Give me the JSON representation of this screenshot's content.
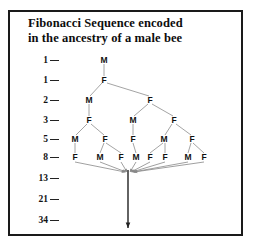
{
  "figure": {
    "title_line_1": "Fibonacci Sequence encoded",
    "title_line_2": "in the ancestry of a male bee",
    "background_color": "#ffffff",
    "frame_color": "#1a1a1a",
    "text_color": "#111111",
    "line_color": "#9a9a9a",
    "arrow_color": "#222222"
  },
  "chart_data": {
    "type": "diagram",
    "title": "Fibonacci Sequence encoded in the ancestry of a male bee",
    "xlabel": "",
    "ylabel": "Fibonacci number (number of ancestors in generation)",
    "categories": [
      "1",
      "1",
      "2",
      "3",
      "5",
      "8",
      "13",
      "21",
      "34"
    ],
    "values": [
      1,
      1,
      2,
      3,
      5,
      8,
      13,
      21,
      34
    ],
    "grid": false,
    "legend": "none",
    "generations": [
      {
        "fib": "1",
        "y": 60,
        "nodes": [
          {
            "sex": "M",
            "x": 104
          }
        ]
      },
      {
        "fib": "1",
        "y": 80,
        "nodes": [
          {
            "sex": "F",
            "x": 104
          }
        ]
      },
      {
        "fib": "2",
        "y": 100,
        "nodes": [
          {
            "sex": "M",
            "x": 89
          },
          {
            "sex": "F",
            "x": 150
          }
        ]
      },
      {
        "fib": "3",
        "y": 120,
        "nodes": [
          {
            "sex": "F",
            "x": 89
          },
          {
            "sex": "M",
            "x": 133
          },
          {
            "sex": "F",
            "x": 174
          }
        ]
      },
      {
        "fib": "5",
        "y": 139,
        "nodes": [
          {
            "sex": "M",
            "x": 75
          },
          {
            "sex": "F",
            "x": 105
          },
          {
            "sex": "F",
            "x": 133
          },
          {
            "sex": "M",
            "x": 164
          },
          {
            "sex": "F",
            "x": 192
          }
        ]
      },
      {
        "fib": "8",
        "y": 157,
        "nodes": [
          {
            "sex": "F",
            "x": 75
          },
          {
            "sex": "M",
            "x": 100
          },
          {
            "sex": "F",
            "x": 121
          },
          {
            "sex": "M",
            "x": 136
          },
          {
            "sex": "F",
            "x": 150
          },
          {
            "sex": "F",
            "x": 165
          },
          {
            "sex": "M",
            "x": 188
          },
          {
            "sex": "F",
            "x": 204
          }
        ]
      },
      {
        "fib": "13",
        "y": 178,
        "nodes": []
      },
      {
        "fib": "21",
        "y": 199,
        "nodes": []
      },
      {
        "fib": "34",
        "y": 220,
        "nodes": []
      }
    ],
    "edges": [
      {
        "x1": 104,
        "y1": 64,
        "x2": 104,
        "y2": 76
      },
      {
        "x1": 102,
        "y1": 83,
        "x2": 90,
        "y2": 96
      },
      {
        "x1": 107,
        "y1": 83,
        "x2": 149,
        "y2": 96
      },
      {
        "x1": 89,
        "y1": 104,
        "x2": 89,
        "y2": 116
      },
      {
        "x1": 148,
        "y1": 104,
        "x2": 134,
        "y2": 116
      },
      {
        "x1": 152,
        "y1": 104,
        "x2": 173,
        "y2": 116
      },
      {
        "x1": 87,
        "y1": 124,
        "x2": 76,
        "y2": 135
      },
      {
        "x1": 91,
        "y1": 124,
        "x2": 104,
        "y2": 135
      },
      {
        "x1": 133,
        "y1": 124,
        "x2": 133,
        "y2": 135
      },
      {
        "x1": 172,
        "y1": 124,
        "x2": 165,
        "y2": 135
      },
      {
        "x1": 176,
        "y1": 124,
        "x2": 191,
        "y2": 135
      },
      {
        "x1": 75,
        "y1": 143,
        "x2": 75,
        "y2": 153
      },
      {
        "x1": 104,
        "y1": 143,
        "x2": 100,
        "y2": 153
      },
      {
        "x1": 106,
        "y1": 143,
        "x2": 121,
        "y2": 153
      },
      {
        "x1": 133,
        "y1": 143,
        "x2": 136,
        "y2": 153
      },
      {
        "x1": 163,
        "y1": 143,
        "x2": 150,
        "y2": 153
      },
      {
        "x1": 165,
        "y1": 143,
        "x2": 165,
        "y2": 153
      },
      {
        "x1": 191,
        "y1": 143,
        "x2": 188,
        "y2": 153
      },
      {
        "x1": 193,
        "y1": 143,
        "x2": 204,
        "y2": 153
      }
    ],
    "converging_arrows": [
      {
        "x1": 75,
        "y1": 162,
        "x2": 125,
        "y2": 172
      },
      {
        "x1": 100,
        "y1": 162,
        "x2": 126,
        "y2": 172
      },
      {
        "x1": 121,
        "y1": 162,
        "x2": 127,
        "y2": 172
      },
      {
        "x1": 136,
        "y1": 162,
        "x2": 130,
        "y2": 172
      },
      {
        "x1": 150,
        "y1": 162,
        "x2": 131,
        "y2": 172
      },
      {
        "x1": 165,
        "y1": 162,
        "x2": 132,
        "y2": 172
      },
      {
        "x1": 188,
        "y1": 162,
        "x2": 133,
        "y2": 172
      },
      {
        "x1": 204,
        "y1": 162,
        "x2": 134,
        "y2": 172
      }
    ],
    "descent_arrow": {
      "x": 128,
      "y_top": 170,
      "y_bottom": 228
    },
    "annotations": [
      "Each generation label on the left gives the Fibonacci count of ancestors.",
      "M = male bee (drone, one parent), F = female bee (queen, two parents)."
    ]
  }
}
